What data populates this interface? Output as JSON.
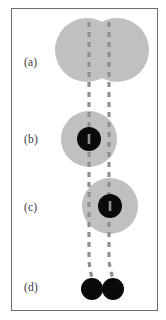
{
  "figure": {
    "type": "scientific-schematic",
    "frame": {
      "border_color": "#6b6b70",
      "background_color": "#ffffff"
    },
    "colors": {
      "grey_body": "#c0c0c0",
      "black_core": "#0a0a0a",
      "dashed_line": "#8f8f93",
      "label_text": "#3a3a3c",
      "frame_border": "#6b6b70"
    },
    "stages": [
      {
        "id": "a",
        "label": "(a)",
        "label_x": 24,
        "label_y": 56,
        "grey_circles": [
          {
            "cx": 87,
            "cy": 50,
            "r": 32
          },
          {
            "cx": 117,
            "cy": 50,
            "r": 32
          }
        ],
        "black_cores": []
      },
      {
        "id": "b",
        "label": "(b)",
        "label_x": 24,
        "label_y": 133,
        "grey_circles": [
          {
            "cx": 89,
            "cy": 139,
            "r": 28
          }
        ],
        "black_cores": [
          {
            "cx": 89,
            "cy": 139,
            "r": 12
          }
        ]
      },
      {
        "id": "c",
        "label": "(c)",
        "label_x": 24,
        "label_y": 201,
        "grey_circles": [
          {
            "cx": 110,
            "cy": 206,
            "r": 28
          }
        ],
        "black_cores": [
          {
            "cx": 110,
            "cy": 206,
            "r": 12
          }
        ]
      },
      {
        "id": "d",
        "label": "(d)",
        "label_x": 24,
        "label_y": 281,
        "grey_circles": [],
        "black_cores": [
          {
            "cx": 92,
            "cy": 289,
            "r": 11
          },
          {
            "cx": 113,
            "cy": 289,
            "r": 11
          }
        ]
      }
    ],
    "dashed_guides": [
      {
        "id": "left-guide",
        "points": [
          [
            89,
            22
          ],
          [
            89,
            262
          ],
          [
            92,
            280
          ]
        ],
        "stroke_width": 3.2,
        "dash": "5 5"
      },
      {
        "id": "right-guide",
        "points": [
          [
            109,
            22
          ],
          [
            109,
            262
          ],
          [
            113,
            280
          ]
        ],
        "stroke_width": 3.2,
        "dash": "5 5"
      }
    ]
  }
}
